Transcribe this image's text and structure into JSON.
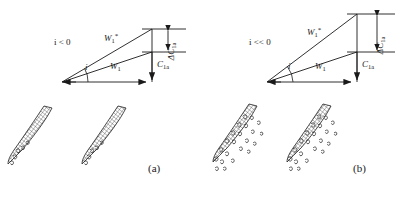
{
  "figure": {
    "type": "technical-diagram",
    "background_color": "#ffffff",
    "line_color": "#1a1a1a",
    "hatch_color": "#3a3a3a"
  },
  "panels": [
    {
      "id": "a",
      "caption": "(a)",
      "caption_x": 148,
      "caption_y": 168,
      "condition_label_parts": {
        "symbol": "i",
        "relation": "< 0"
      },
      "condition_label_text": "i < 0",
      "description": "Mildly negative incidence: small leading-edge separation bubble",
      "velocity_triangle": {
        "apex": {
          "x": 62,
          "y": 82
        },
        "w1_tip": {
          "x": 152,
          "y": 82
        },
        "w1_star_tip": {
          "x": 152,
          "y": 29
        },
        "c1a_foot": {
          "x": 152,
          "y": 82
        },
        "c1a_head_top": {
          "x": 152,
          "y": 52
        },
        "upper_datum_y": 29,
        "lower_datum_y": 52,
        "datum_x_start": 142,
        "datum_x_end": 186,
        "incidence_arc_radius": 26,
        "labels": {
          "w1_star": {
            "base": "W",
            "sub": "1",
            "sup": "*",
            "x": 104,
            "y": 37
          },
          "w1": {
            "base": "W",
            "sub": "1",
            "x": 110,
            "y": 66
          },
          "c1a": {
            "base": "C",
            "sub": "1a",
            "x": 156,
            "y": 64
          },
          "delta_c1a": {
            "base": "ΔC",
            "sub": "1a",
            "x": 172,
            "y": 52
          },
          "incidence": {
            "base": "i",
            "x": 84,
            "y": 62
          },
          "condition": {
            "x": 54,
            "y": 38
          }
        }
      },
      "blades": [
        {
          "id": "blade-a-1",
          "ox": 8,
          "oy": 100,
          "separation": "small"
        },
        {
          "id": "blade-a-2",
          "ox": 82,
          "oy": 100,
          "separation": "small"
        }
      ]
    },
    {
      "id": "b",
      "caption": "(b)",
      "caption_x": 148,
      "caption_y": 168,
      "condition_label_parts": {
        "symbol": "i",
        "relation": "<< 0"
      },
      "condition_label_text": "i << 0",
      "description": "Strongly negative incidence: large-scale stall and massive separation over blade pressure surface",
      "velocity_triangle": {
        "apex": {
          "x": 62,
          "y": 82
        },
        "w1_tip": {
          "x": 152,
          "y": 82
        },
        "w1_star_tip": {
          "x": 152,
          "y": 14
        },
        "c1a_foot": {
          "x": 152,
          "y": 82
        },
        "c1a_head_top": {
          "x": 152,
          "y": 52
        },
        "upper_datum_y": 14,
        "lower_datum_y": 52,
        "datum_x_start": 142,
        "datum_x_end": 190,
        "incidence_arc_radius": 26,
        "labels": {
          "w1_star": {
            "base": "W",
            "sub": "1",
            "sup": "*",
            "x": 102,
            "y": 31
          },
          "w1": {
            "base": "W",
            "sub": "1",
            "x": 110,
            "y": 66
          },
          "c1a": {
            "base": "C",
            "sub": "1a",
            "x": 156,
            "y": 64
          },
          "delta_c1a": {
            "base": "ΔC",
            "sub": "1a",
            "x": 176,
            "y": 46
          },
          "incidence": {
            "base": "i",
            "x": 84,
            "y": 62
          },
          "condition": {
            "x": 44,
            "y": 38
          }
        }
      },
      "blades": [
        {
          "id": "blade-b-1",
          "ox": 8,
          "oy": 100,
          "separation": "large"
        },
        {
          "id": "blade-b-2",
          "ox": 82,
          "oy": 100,
          "separation": "large"
        }
      ]
    }
  ],
  "symbols": {
    "w1_star": "W₁*",
    "w1": "W₁",
    "c1a": "C₁ₐ",
    "delta_c1a": "ΔC₁ₐ",
    "incidence_angle": "i"
  }
}
